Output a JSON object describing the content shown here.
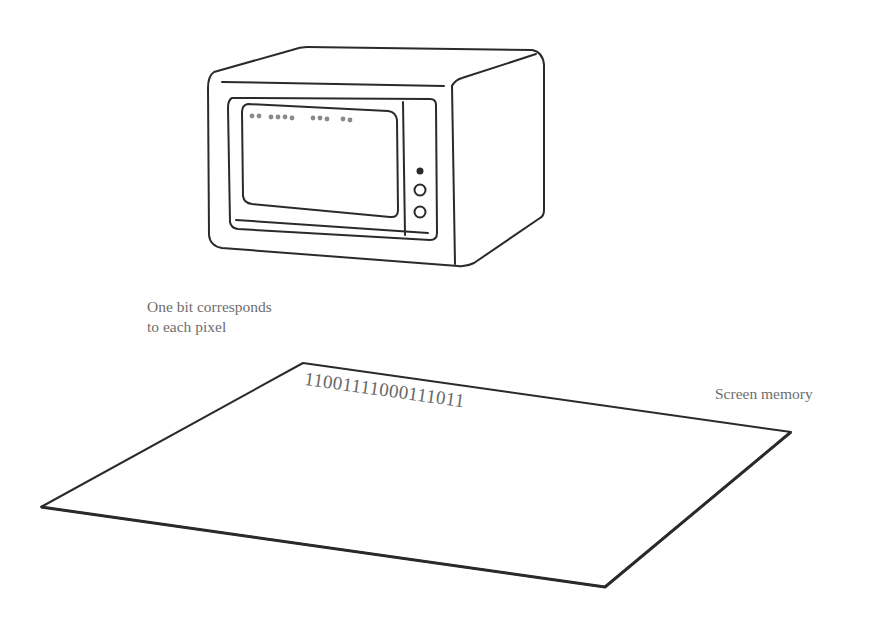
{
  "diagram": {
    "monitor": {
      "screen_dots_pattern": "●● ●●●● ●●● ●●",
      "indicator_light": "filled",
      "buttons": 2
    },
    "annotation": {
      "line1": "One bit corresponds",
      "line2": "to each pixel"
    },
    "memory_plane": {
      "bits": "11001111000111011",
      "label": "Screen memory"
    },
    "colors": {
      "stroke": "#2a2a2a",
      "text": "#6e6e6e",
      "dots": "#8a8a8a"
    }
  }
}
